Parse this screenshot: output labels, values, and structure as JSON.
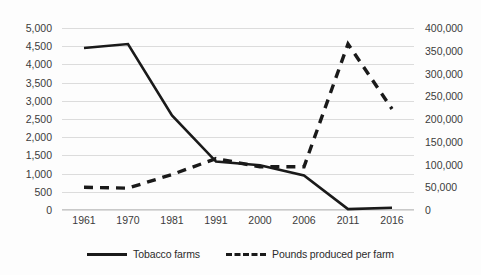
{
  "chart_data": {
    "type": "line",
    "title": "",
    "xlabel": "",
    "categories": [
      "1961",
      "1970",
      "1981",
      "1991",
      "2000",
      "2006",
      "2011",
      "2016"
    ],
    "grid": true,
    "legend_position": "bottom",
    "series": [
      {
        "name": "Tobacco farms",
        "axis": "left",
        "style": "solid",
        "color": "#1a1a1a",
        "values": [
          4450,
          4560,
          2600,
          1330,
          1230,
          950,
          25,
          60
        ]
      },
      {
        "name": "Pounds produced per farm",
        "axis": "right",
        "style": "dashed",
        "color": "#1a1a1a",
        "values": [
          50000,
          48000,
          78000,
          113000,
          95000,
          95000,
          365000,
          222000
        ]
      }
    ],
    "left_axis": {
      "label": "",
      "ylim": [
        0,
        5000
      ],
      "tick_step": 500,
      "ticks": [
        "5,000",
        "4,500",
        "4,000",
        "3,500",
        "3,000",
        "2,500",
        "2,000",
        "1,500",
        "1,000",
        "500",
        "0"
      ],
      "tick_values": [
        5000,
        4500,
        4000,
        3500,
        3000,
        2500,
        2000,
        1500,
        1000,
        500,
        0
      ]
    },
    "right_axis": {
      "label": "",
      "ylim": [
        0,
        400000
      ],
      "tick_step": 50000,
      "ticks": [
        "400,000",
        "350,000",
        "300,000",
        "250,000",
        "200,000",
        "150,000",
        "100,000",
        "50,000",
        "0"
      ],
      "tick_values": [
        400000,
        350000,
        300000,
        250000,
        200000,
        150000,
        100000,
        50000,
        0
      ]
    },
    "legend": [
      {
        "label": "Tobacco farms",
        "style": "solid"
      },
      {
        "label": "Pounds produced per farm",
        "style": "dashed"
      }
    ]
  }
}
